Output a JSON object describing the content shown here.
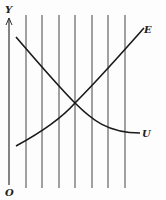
{
  "diagram": {
    "axis_y_label": "Y",
    "origin_label": "O",
    "curve_e_label": "E",
    "curve_u_label": "U",
    "vertical_lines_x": [
      26,
      42,
      59,
      75,
      92,
      108,
      125
    ],
    "line_color": "#333333",
    "intersection": [
      75,
      103
    ]
  }
}
